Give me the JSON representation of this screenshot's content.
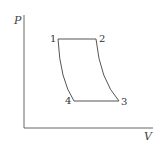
{
  "diagram": {
    "type": "PV cycle diagram",
    "axes": {
      "y_label": "P",
      "x_label": "V"
    },
    "points": [
      {
        "label": "1",
        "x": 58,
        "y": 39
      },
      {
        "label": "2",
        "x": 96,
        "y": 39
      },
      {
        "label": "3",
        "x": 119,
        "y": 101
      },
      {
        "label": "4",
        "x": 74,
        "y": 101
      }
    ],
    "segments": [
      {
        "from": "1",
        "to": "2",
        "shape": "horizontal line"
      },
      {
        "from": "2",
        "to": "3",
        "shape": "curve"
      },
      {
        "from": "3",
        "to": "4",
        "shape": "horizontal line"
      },
      {
        "from": "4",
        "to": "1",
        "shape": "curve"
      }
    ],
    "colors": {
      "line": "#555555",
      "text": "#333333"
    }
  }
}
